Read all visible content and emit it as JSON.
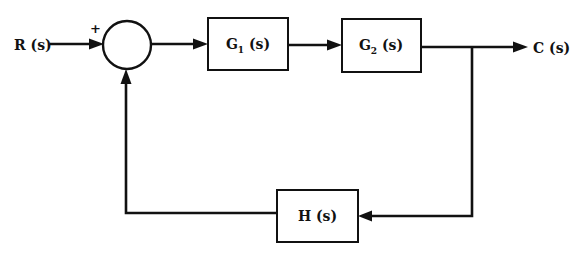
{
  "diagram": {
    "type": "feedback-control-block-diagram",
    "input": {
      "label": "R (s)"
    },
    "output": {
      "label": "C (s)"
    },
    "summing_junction": {
      "sign_input": "+"
    },
    "blocks": [
      {
        "id": "g1",
        "name": "G",
        "subscript": "1",
        "arg": " (s)"
      },
      {
        "id": "g2",
        "name": "G",
        "subscript": "2",
        "arg": " (s)"
      },
      {
        "id": "h",
        "name": "H",
        "subscript": "",
        "arg": " (s)"
      }
    ],
    "connections": [
      {
        "from": "R(s)",
        "to": "summing_junction"
      },
      {
        "from": "summing_junction",
        "to": "g1"
      },
      {
        "from": "g1",
        "to": "g2"
      },
      {
        "from": "g2",
        "to": "C(s)"
      },
      {
        "from": "C(s)",
        "to": "h",
        "kind": "feedback"
      },
      {
        "from": "h",
        "to": "summing_junction",
        "kind": "feedback"
      }
    ]
  }
}
